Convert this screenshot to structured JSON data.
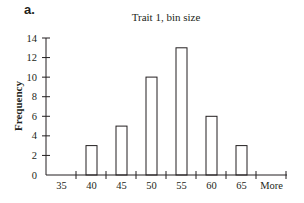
{
  "panel_label": "a.",
  "chart_data": {
    "type": "bar",
    "title": "Trait 1, bin size",
    "xlabel": "",
    "ylabel": "Frequency",
    "categories": [
      "35",
      "40",
      "45",
      "50",
      "55",
      "60",
      "65",
      "More"
    ],
    "values": [
      0,
      3,
      5,
      10,
      13,
      6,
      3,
      0
    ],
    "ylim": [
      0,
      14
    ],
    "yticks": [
      0,
      2,
      4,
      6,
      8,
      10,
      12,
      14
    ],
    "grid": false,
    "legend": null,
    "bar_fill": "#ffffff",
    "bar_stroke": "#231f20"
  }
}
